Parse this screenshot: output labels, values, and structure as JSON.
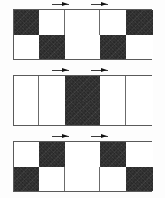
{
  "figure": {
    "background_color": "#fdfdfd",
    "frame_color": "#5a5a5a",
    "dark_fill_color": "#141414",
    "light_fill_color": "#ffffff",
    "panel_count": 3,
    "columns": 5,
    "rows": 2
  },
  "panels": [
    {
      "id": "panel-a",
      "label": "a",
      "top": 9,
      "height": 51,
      "column_widths": [
        25,
        26,
        35,
        26,
        27
      ],
      "rows": [
        [
          "dark",
          "light",
          "light",
          "light",
          "dark"
        ],
        [
          "light",
          "dark",
          "light",
          "dark",
          "light"
        ]
      ],
      "markers": [
        {
          "name": "marker-left",
          "left": 52,
          "direction": "right"
        },
        {
          "name": "marker-right",
          "left": 91,
          "direction": "right"
        }
      ]
    },
    {
      "id": "panel-b",
      "label": "b",
      "top": 75,
      "height": 51,
      "column_widths": [
        25,
        26,
        35,
        26,
        27
      ],
      "rows": [
        [
          "light",
          "light",
          "dark",
          "light",
          "light"
        ],
        [
          "light",
          "light",
          "dark",
          "light",
          "light"
        ]
      ],
      "markers": [
        {
          "name": "marker-left",
          "left": 52,
          "direction": "right"
        },
        {
          "name": "marker-right",
          "left": 91,
          "direction": "right"
        }
      ]
    },
    {
      "id": "panel-c",
      "label": "c",
      "top": 141,
      "height": 51,
      "column_widths": [
        25,
        26,
        35,
        26,
        27
      ],
      "rows": [
        [
          "light",
          "dark",
          "light",
          "dark",
          "light"
        ],
        [
          "dark",
          "light",
          "light",
          "light",
          "dark"
        ]
      ],
      "markers": [
        {
          "name": "marker-left",
          "left": 52,
          "direction": "right"
        },
        {
          "name": "marker-right",
          "left": 91,
          "direction": "right"
        }
      ]
    }
  ]
}
